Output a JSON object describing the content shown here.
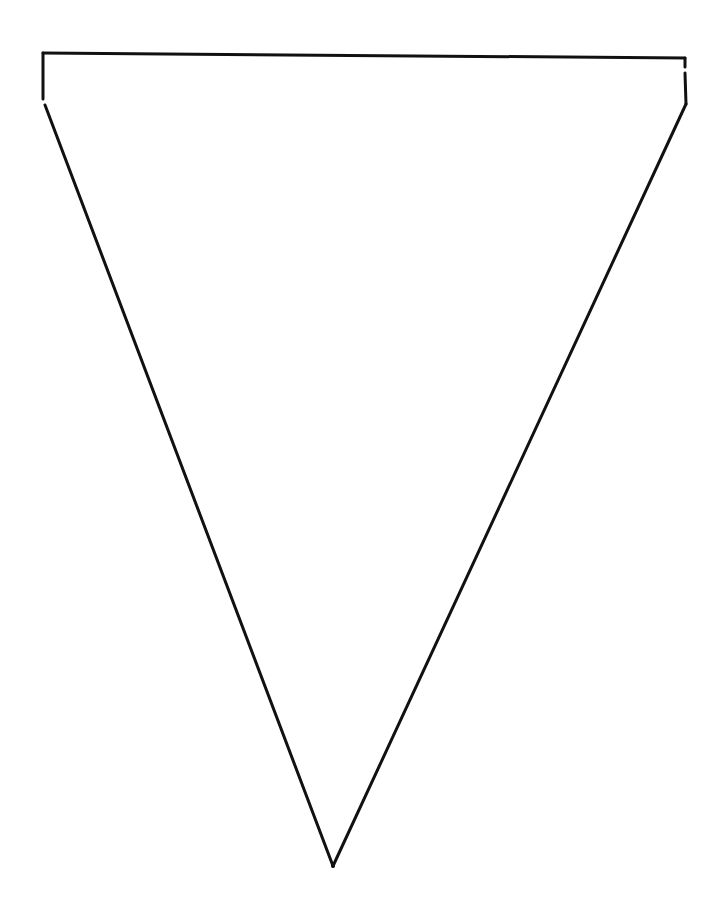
{
  "page": {
    "background_color": "#ffffff",
    "line_color": "#111111"
  },
  "shape": {
    "type": "pennant-triangle",
    "label": "",
    "fill": "none"
  }
}
